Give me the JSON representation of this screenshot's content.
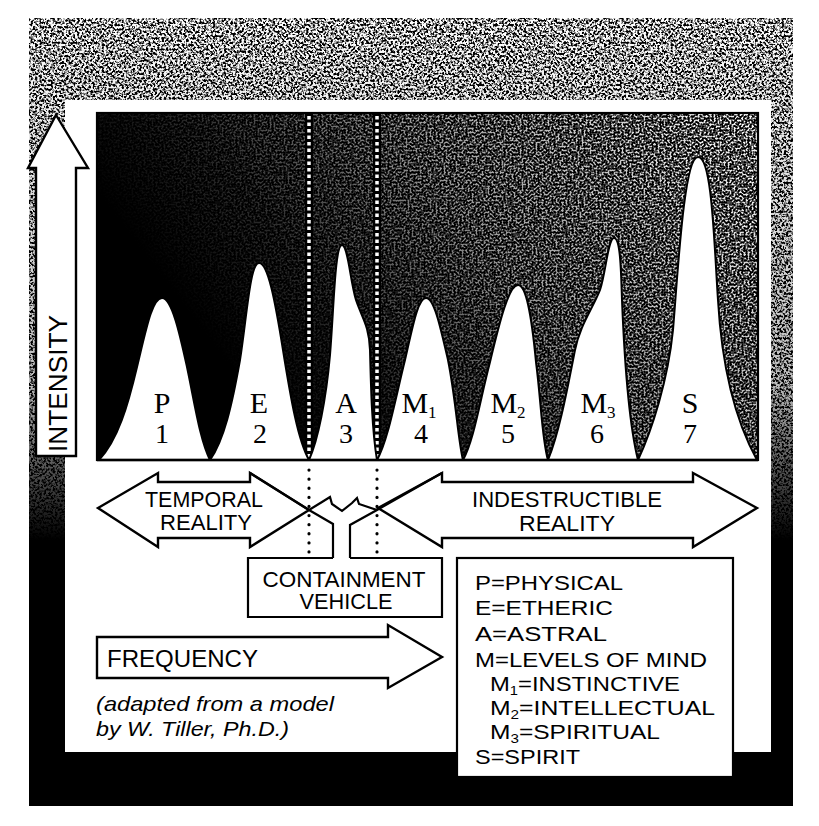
{
  "figure": {
    "axes": {
      "y_label": "INTENSITY",
      "x_label": "FREQUENCY"
    },
    "peaks": [
      {
        "letter": "P",
        "subscript": "",
        "number": "1",
        "relative_height": 0.47
      },
      {
        "letter": "E",
        "subscript": "",
        "number": "2",
        "relative_height": 0.57
      },
      {
        "letter": "A",
        "subscript": "",
        "number": "3",
        "relative_height": 0.62
      },
      {
        "letter": "M",
        "subscript": "1",
        "number": "4",
        "relative_height": 0.47
      },
      {
        "letter": "M",
        "subscript": "2",
        "number": "5",
        "relative_height": 0.5
      },
      {
        "letter": "M",
        "subscript": "3",
        "number": "6",
        "relative_height": 0.64
      },
      {
        "letter": "S",
        "subscript": "",
        "number": "7",
        "relative_height": 0.87
      }
    ],
    "regions": {
      "temporal": {
        "line1": "TEMPORAL",
        "line2": "REALITY"
      },
      "indestructible": {
        "line1": "INDESTRUCTIBLE",
        "line2": "REALITY"
      },
      "containment": {
        "line1": "CONTAINMENT",
        "line2": "VEHICLE"
      }
    },
    "legend": {
      "separator": "=",
      "items": [
        {
          "label": "P",
          "sub": "",
          "value": "PHYSICAL"
        },
        {
          "label": "E",
          "sub": "",
          "value": "ETHERIC"
        },
        {
          "label": "A",
          "sub": "",
          "value": "ASTRAL"
        },
        {
          "label": "M",
          "sub": "",
          "value": "LEVELS OF MIND"
        },
        {
          "label": "M",
          "sub": "1",
          "value": "INSTINCTIVE"
        },
        {
          "label": "M",
          "sub": "2",
          "value": "INTELLECTUAL"
        },
        {
          "label": "M",
          "sub": "3",
          "value": "SPIRITUAL"
        },
        {
          "label": "S",
          "sub": "",
          "value": "SPIRIT"
        }
      ]
    },
    "credit": {
      "line1": "(adapted from a model",
      "line2": "by W. Tiller, Ph.D.)"
    }
  },
  "colors": {
    "ink": "#000000",
    "paper": "#ffffff"
  }
}
